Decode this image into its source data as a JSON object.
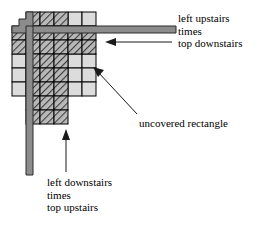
{
  "figure": {
    "type": "staircase-product-diagram",
    "width": 279,
    "height": 229,
    "background": "#ffffff"
  },
  "colors": {
    "hatched_fill": "#b9b9b9",
    "hatch_stroke": "#3a3a3a",
    "light_cell_fill": "#dcdcdc",
    "cell_border": "#000000",
    "bar_fill": "#8c8c8c",
    "bar_stroke": "#2b2b2b",
    "arrow": "#1a1a1a",
    "text": "#000000"
  },
  "annotations": [
    {
      "id": "left-upstairs",
      "lines": [
        "left upstairs",
        "times",
        "top downstairs"
      ],
      "arrow": "horizontal-left"
    },
    {
      "id": "uncovered-rectangle",
      "lines": [
        "uncovered rectangle"
      ],
      "arrow": "diagonal-up-left"
    },
    {
      "id": "left-downstairs",
      "lines": [
        "left downstairs",
        "times",
        "top upstairs"
      ],
      "arrow": "vertical-up"
    }
  ],
  "labels": {
    "left_upstairs": {
      "line1": "left upstairs",
      "line2": "times",
      "line3": "top downstairs"
    },
    "uncovered": {
      "line1": "uncovered rectangle"
    },
    "left_downstairs": {
      "line1": "left downstairs",
      "line2": "times",
      "line3": "top upstairs"
    }
  },
  "grid": {
    "cell_width": 14,
    "cell_height": 14,
    "origin_x": 26,
    "origin_y": 12,
    "description": "Grid of cells; hatched cells are covered products, light gray cells form the uncovered rectangle regions."
  },
  "bars": {
    "horizontal": {
      "label": "top staircase bar",
      "extends_to_x": 176
    },
    "vertical": {
      "label": "left staircase bar",
      "extends_to_y": 175
    }
  }
}
